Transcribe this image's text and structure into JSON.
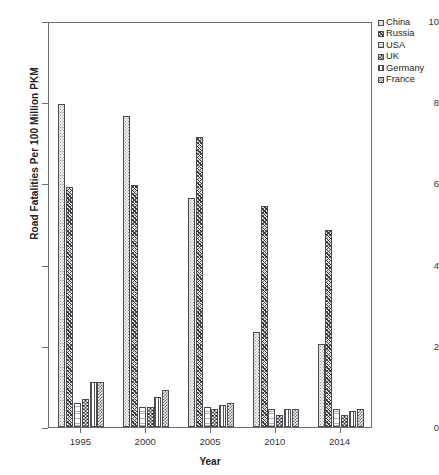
{
  "top_caption": "",
  "legend": {
    "position": "right",
    "entries": [
      {
        "label": "China",
        "pattern": "pat-china"
      },
      {
        "label": "Russia",
        "pattern": "pat-russia"
      },
      {
        "label": "USA",
        "pattern": "pat-usa"
      },
      {
        "label": "UK",
        "pattern": "pat-uk"
      },
      {
        "label": "Germany",
        "pattern": "pat-germany"
      },
      {
        "label": "France",
        "pattern": "pat-france"
      }
    ]
  },
  "axes": {
    "y_title": "Road Fatalities Per 100 Million PKM",
    "x_title": "Year",
    "y_ticks": [
      "0",
      "2",
      "4",
      "6",
      "8",
      "10"
    ],
    "x_ticks": [
      "1995",
      "2000",
      "2005",
      "2010",
      "2014"
    ]
  },
  "chart_data": {
    "type": "bar",
    "title": "",
    "subtitle": "",
    "xlabel": "Year",
    "ylabel": "Road Fatalities Per 100 Million PKM",
    "categories": [
      "1995",
      "2000",
      "2005",
      "2010",
      "2014"
    ],
    "ylim": [
      0,
      10
    ],
    "yticks": [
      0,
      2,
      4,
      6,
      8,
      10
    ],
    "grid": false,
    "legend_position": "right",
    "series": [
      {
        "name": "China",
        "pattern": "pat-china",
        "values": [
          7.95,
          7.65,
          5.65,
          2.35,
          2.05
        ]
      },
      {
        "name": "Russia",
        "pattern": "pat-russia",
        "values": [
          5.9,
          5.95,
          7.15,
          5.45,
          4.85
        ]
      },
      {
        "name": "USA",
        "pattern": "pat-usa",
        "values": [
          0.6,
          0.5,
          0.5,
          0.45,
          0.45
        ]
      },
      {
        "name": "UK",
        "pattern": "pat-uk",
        "values": [
          0.7,
          0.5,
          0.45,
          0.3,
          0.3
        ]
      },
      {
        "name": "Germany",
        "pattern": "pat-germany",
        "values": [
          1.1,
          0.75,
          0.55,
          0.45,
          0.4
        ]
      },
      {
        "name": "France",
        "pattern": "pat-france",
        "values": [
          1.1,
          0.9,
          0.6,
          0.45,
          0.45
        ]
      }
    ]
  }
}
